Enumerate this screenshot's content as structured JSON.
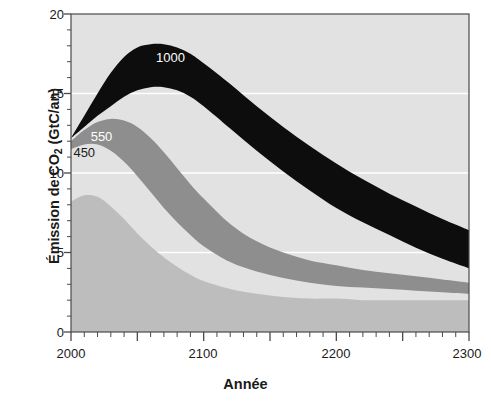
{
  "figure": {
    "background": "#ffffff",
    "plot_background": "#e2e2e2",
    "axis_color": "#3a3a3a"
  },
  "axes": {
    "y_title": "Émission de CO",
    "y_title_sub": "2",
    "y_title_unit": " (GtC/an)",
    "y_title_full": "Émission de CO2 (GtC/an)",
    "x_title": "Année"
  },
  "chart_data": {
    "type": "area",
    "title": "",
    "subtitle": "",
    "xlabel": "Année",
    "ylabel": "Émission de CO2 (GtC/an)",
    "xlim": [
      2000,
      2300
    ],
    "ylim": [
      0,
      20
    ],
    "x_ticks": [
      2000,
      2100,
      2200,
      2300
    ],
    "x_tick_labels": [
      "2000",
      "2100",
      "2200",
      "2300"
    ],
    "x_major_ticks": [
      2000,
      2050,
      2100,
      2150,
      2200,
      2250,
      2300
    ],
    "x_minor_tick_step": 10,
    "y_ticks": [
      0,
      5,
      10,
      15,
      20
    ],
    "y_tick_labels": [
      "0",
      "5",
      "10",
      "15",
      "20"
    ],
    "y_minor_tick_step": 1,
    "grid": "horizontal white gridlines at 5, 10, 15",
    "gridlines_y": [
      5,
      10,
      15
    ],
    "gridline_color": "#ffffff",
    "legend": "inline band labels",
    "legend_position": "inline",
    "annotations": [
      {
        "text": "1000",
        "x": 2075,
        "y": 17.0,
        "color": "#ffffff"
      },
      {
        "text": "550",
        "x": 2023,
        "y": 12.0,
        "color": "#ffffff"
      },
      {
        "text": "450",
        "x": 2010,
        "y": 11.0,
        "color": "#1a1a1a"
      }
    ],
    "series": [
      {
        "name": "1000",
        "label": "1000",
        "color": "#0d0d0d",
        "label_color": "#ffffff",
        "x": [
          2000,
          2010,
          2020,
          2030,
          2040,
          2050,
          2060,
          2070,
          2080,
          2090,
          2100,
          2120,
          2140,
          2160,
          2180,
          2200,
          2220,
          2240,
          2260,
          2280,
          2300
        ],
        "upper": [
          12.2,
          13.6,
          15.0,
          16.3,
          17.3,
          17.9,
          18.1,
          18.1,
          17.9,
          17.5,
          16.9,
          15.6,
          14.2,
          12.9,
          11.7,
          10.6,
          9.6,
          8.7,
          7.9,
          7.1,
          6.4
        ],
        "lower": [
          12.2,
          12.9,
          13.6,
          14.2,
          14.8,
          15.2,
          15.4,
          15.4,
          15.2,
          14.8,
          14.2,
          12.8,
          11.4,
          10.1,
          8.9,
          7.8,
          6.9,
          6.1,
          5.3,
          4.6,
          4.0
        ]
      },
      {
        "name": "550",
        "label": "550",
        "color": "#8e8e8e",
        "label_color": "#ffffff",
        "x": [
          2000,
          2010,
          2020,
          2030,
          2040,
          2050,
          2060,
          2070,
          2080,
          2090,
          2100,
          2120,
          2140,
          2160,
          2180,
          2200,
          2220,
          2240,
          2260,
          2280,
          2300
        ],
        "upper": [
          12.0,
          12.7,
          13.2,
          13.4,
          13.3,
          12.9,
          12.2,
          11.3,
          10.3,
          9.3,
          8.4,
          6.8,
          5.7,
          5.0,
          4.5,
          4.2,
          3.9,
          3.7,
          3.5,
          3.3,
          3.1
        ],
        "lower": [
          11.5,
          11.8,
          11.8,
          11.4,
          10.7,
          9.8,
          8.8,
          7.8,
          6.9,
          6.1,
          5.4,
          4.4,
          3.8,
          3.4,
          3.1,
          2.9,
          2.8,
          2.7,
          2.6,
          2.5,
          2.4
        ]
      },
      {
        "name": "450",
        "label": "450",
        "color": "#bdbdbd",
        "label_color": "#1a1a1a",
        "x": [
          2000,
          2010,
          2020,
          2030,
          2040,
          2050,
          2060,
          2070,
          2080,
          2090,
          2100,
          2120,
          2140,
          2160,
          2180,
          2200,
          2220,
          2240,
          2260,
          2280,
          2300
        ],
        "upper": [
          8.2,
          8.6,
          8.5,
          7.9,
          7.1,
          6.2,
          5.4,
          4.7,
          4.1,
          3.6,
          3.2,
          2.7,
          2.4,
          2.2,
          2.1,
          2.1,
          2.0,
          2.0,
          2.0,
          2.0,
          2.0
        ],
        "lower": [
          0.0,
          0.0,
          0.0,
          0.0,
          0.0,
          0.0,
          0.0,
          0.0,
          0.0,
          0.0,
          0.0,
          0.0,
          0.0,
          0.0,
          0.0,
          0.0,
          0.0,
          0.0,
          0.0,
          0.0,
          0.0
        ]
      }
    ],
    "band_colors": {
      "dark": "#0d0d0d",
      "mid_gray": "#8e8e8e",
      "light_gray": "#bdbdbd",
      "plot_bg": "#e2e2e2",
      "white_gap": "#fbfbfb"
    }
  }
}
